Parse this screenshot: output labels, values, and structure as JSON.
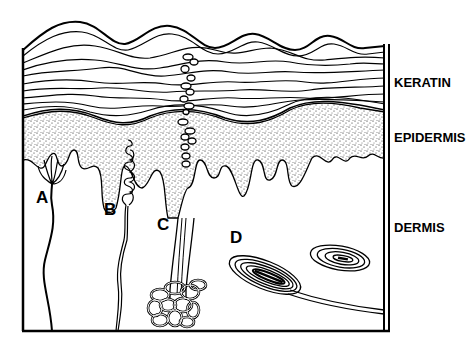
{
  "diagram": {
    "layers": [
      {
        "id": "keratin",
        "label": "KERATIN"
      },
      {
        "id": "epidermis",
        "label": "EPIDERMIS"
      },
      {
        "id": "dermis",
        "label": "DERMIS"
      }
    ],
    "structures": [
      {
        "id": "A",
        "label": "A"
      },
      {
        "id": "B",
        "label": "B"
      },
      {
        "id": "C",
        "label": "C"
      },
      {
        "id": "D",
        "label": "D"
      }
    ],
    "colors": {
      "ink": "#000000",
      "background": "#ffffff"
    }
  }
}
